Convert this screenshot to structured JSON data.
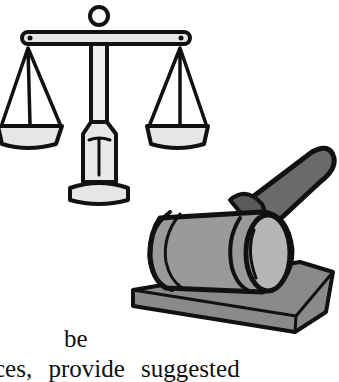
{
  "document": {
    "image": {
      "description": "clip art of justice scales and a judge's gavel on a sound block",
      "icons": [
        "scales-of-justice-icon",
        "gavel-icon"
      ]
    },
    "text_lines": [
      "be",
      "ces, provide suggested"
    ]
  }
}
